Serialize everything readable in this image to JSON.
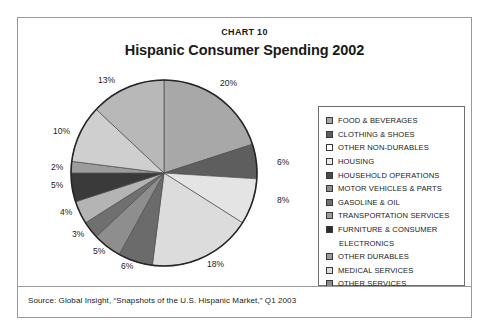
{
  "frame": {
    "chart_number": "CHART 10",
    "title": "Hispanic Consumer Spending 2002",
    "source": "Source: Global Insight, “Snapshots of the U.S. Hispanic Market,” Q1 2003"
  },
  "chart_data": {
    "type": "pie",
    "title": "Hispanic Consumer Spending 2002",
    "subtitle": "CHART 10",
    "xlabel": "",
    "ylabel": "",
    "grid": false,
    "legend_position": "right",
    "start_angle_deg": 0,
    "direction": "clockwise",
    "total": 100,
    "units": "percent",
    "categories": [
      "FOOD & BEVERAGES",
      "CLOTHING & SHOES",
      "OTHER NON-DURABLES",
      "HOUSING",
      "HOUSEHOLD OPERATIONS",
      "MOTOR VEHICLES & PARTS",
      "GASOLINE & OIL",
      "TRANSPORTATION SERVICES",
      "FURNITURE & CONSUMER ELECTRONICS",
      "OTHER DURABLES",
      "MEDICAL SERVICES",
      "OTHER SERVICES"
    ],
    "values": [
      20,
      6,
      8,
      18,
      6,
      5,
      3,
      4,
      5,
      2,
      10,
      13
    ],
    "labels": [
      "20%",
      "6%",
      "8%",
      "18%",
      "6%",
      "5%",
      "3%",
      "4%",
      "5%",
      "2%",
      "10%",
      "13%"
    ],
    "colors": [
      "#a8a8a8",
      "#5e5e5e",
      "#e4e4e4",
      "#dcdcdc",
      "#6b6b6b",
      "#8e8e8e",
      "#707070",
      "#b4b4b4",
      "#3a3a3a",
      "#9c9c9c",
      "#cfcfcf",
      "#b8b8b8"
    ],
    "slices": [
      {
        "label": "FOOD & BEVERAGES",
        "value": 20,
        "display": "20%",
        "color": "#a8a8a8"
      },
      {
        "label": "CLOTHING & SHOES",
        "value": 6,
        "display": "6%",
        "color": "#5e5e5e"
      },
      {
        "label": "OTHER NON-DURABLES",
        "value": 8,
        "display": "8%",
        "color": "#e4e4e4"
      },
      {
        "label": "HOUSING",
        "value": 18,
        "display": "18%",
        "color": "#dcdcdc"
      },
      {
        "label": "HOUSEHOLD OPERATIONS",
        "value": 6,
        "display": "6%",
        "color": "#6b6b6b"
      },
      {
        "label": "MOTOR VEHICLES & PARTS",
        "value": 5,
        "display": "5%",
        "color": "#8e8e8e"
      },
      {
        "label": "GASOLINE & OIL",
        "value": 3,
        "display": "3%",
        "color": "#707070"
      },
      {
        "label": "TRANSPORTATION SERVICES",
        "value": 4,
        "display": "4%",
        "color": "#b4b4b4"
      },
      {
        "label": "FURNITURE & CONSUMER ELECTRONICS",
        "value": 5,
        "display": "5%",
        "color": "#3a3a3a"
      },
      {
        "label": "OTHER DURABLES",
        "value": 2,
        "display": "2%",
        "color": "#9c9c9c"
      },
      {
        "label": "MEDICAL SERVICES",
        "value": 10,
        "display": "10%",
        "color": "#cfcfcf"
      },
      {
        "label": "OTHER SERVICES",
        "value": 13,
        "display": "13%",
        "color": "#b8b8b8"
      }
    ]
  },
  "legend": {
    "items": [
      {
        "label": "FOOD & BEVERAGES",
        "swatch": "#a8a8a8"
      },
      {
        "label": "CLOTHING & SHOES",
        "swatch": "#5e5e5e"
      },
      {
        "label": "OTHER NON-DURABLES",
        "swatch": "#ffffff"
      },
      {
        "label": "HOUSING",
        "swatch": "#e8e8e8"
      },
      {
        "label": "HOUSEHOLD OPERATIONS",
        "swatch": "#4a4a4a"
      },
      {
        "label": "MOTOR VEHICLES & PARTS",
        "swatch": "#8e8e8e"
      },
      {
        "label": "GASOLINE & OIL",
        "swatch": "#707070"
      },
      {
        "label": "TRANSPORTATION SERVICES",
        "swatch": "#9e9e9e"
      },
      {
        "label": "FURNITURE & CONSUMER",
        "label_cont": "ELECTRONICS",
        "swatch": "#2b2b2b"
      },
      {
        "label": "OTHER DURABLES",
        "swatch": "#9c9c9c"
      },
      {
        "label": "MEDICAL SERVICES",
        "swatch": "#dcdcdc"
      },
      {
        "label": "OTHER SERVICES",
        "swatch": "#8a8a8a"
      }
    ]
  },
  "pie_geometry": {
    "cx": 140,
    "cy": 103,
    "r": 93,
    "label_positions": [
      {
        "text": "20%",
        "x": 196,
        "y": 8
      },
      {
        "text": "6%",
        "x": 253,
        "y": 87
      },
      {
        "text": "8%",
        "x": 253,
        "y": 125
      },
      {
        "text": "18%",
        "x": 183,
        "y": 189
      },
      {
        "text": "6%",
        "x": 97,
        "y": 191
      },
      {
        "text": "5%",
        "x": 69,
        "y": 176
      },
      {
        "text": "3%",
        "x": 48,
        "y": 159
      },
      {
        "text": "4%",
        "x": 36,
        "y": 137
      },
      {
        "text": "5%",
        "x": 27,
        "y": 110
      },
      {
        "text": "2%",
        "x": 27,
        "y": 92
      },
      {
        "text": "10%",
        "x": 29,
        "y": 56
      },
      {
        "text": "13%",
        "x": 74,
        "y": 5
      }
    ]
  }
}
